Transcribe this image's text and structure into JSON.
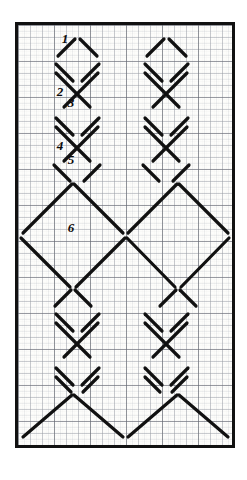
{
  "figure": {
    "frame": {
      "x": 15,
      "y": 22,
      "width": 220,
      "height": 426,
      "border_color": "#111111",
      "border_width": 3,
      "paper_color": "#fdfdfb"
    },
    "grid": {
      "visible": true,
      "minor_spacing": 6,
      "major_spacing": 12,
      "heavy_spacing": 36,
      "minor_color": "#b9bcc4",
      "major_color": "#8d9199",
      "heavy_color": "#5b5f66"
    },
    "ink": {
      "color": "#111111",
      "stroke_width": 3.2,
      "gap": 2.2
    },
    "columns": {
      "left_center_x": 55,
      "right_center_x": 160,
      "diamond_half_width": 19,
      "diamond_half_height": 18
    },
    "labels": [
      {
        "id": "1",
        "text": "1",
        "x": 47,
        "y": 18,
        "marks_segment": "upper-left edge of first small diamond"
      },
      {
        "id": "2",
        "text": "2",
        "x": 42,
        "y": 71,
        "marks_segment": "descending stroke of second crossing"
      },
      {
        "id": "3",
        "text": "3",
        "x": 51,
        "y": 82,
        "marks_segment": "ascending stroke of second crossing"
      },
      {
        "id": "4",
        "text": "4",
        "x": 42,
        "y": 125,
        "marks_segment": "short crossing stroke above large diamond"
      },
      {
        "id": "5",
        "text": "5",
        "x": 52,
        "y": 139,
        "marks_segment": "long descending edge of large diamond"
      },
      {
        "id": "6",
        "text": "6",
        "x": 52,
        "y": 205,
        "marks_segment": "lower-left edge of large diamond"
      }
    ],
    "segments": {
      "small_diamond_rows_left": [
        30,
        66,
        102,
        138
      ],
      "small_diamond_rows_right": [
        30,
        66,
        102,
        138
      ],
      "small_diamond_rows_left_lower": [
        252,
        288,
        324
      ],
      "small_diamond_rows_right_lower": [
        252,
        288,
        324
      ],
      "large_diamond_centers": [
        {
          "cx": 55,
          "cy": 210,
          "half": 52
        },
        {
          "cx": 160,
          "cy": 210,
          "half": 52
        },
        {
          "cx": 55,
          "cy": 360,
          "half": 52
        },
        {
          "cx": 160,
          "cy": 360,
          "half": 52
        }
      ]
    },
    "counts": {
      "labeled_segments": 6,
      "columns": 2
    }
  }
}
